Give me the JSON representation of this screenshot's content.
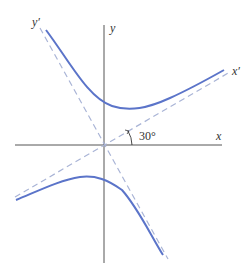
{
  "diagram": {
    "colors": {
      "background": "#ffffff",
      "axes": "#555555",
      "rotated_axes": "#a9b4d6",
      "curve": "#5b74c9",
      "text": "#333333"
    },
    "labels": {
      "x_axis": "x",
      "y_axis": "y",
      "x_prime_axis": "x′",
      "y_prime_axis": "y′",
      "angle": "30°"
    },
    "rotation_angle_deg": 30
  }
}
